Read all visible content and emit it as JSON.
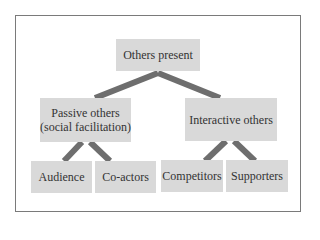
{
  "diagram": {
    "type": "tree",
    "colors": {
      "box_fill": "#d9d9d9",
      "connector": "#6e6e6e",
      "frame": "#7a7a7a",
      "text": "#333333"
    },
    "root": {
      "label": "Others present"
    },
    "level1": [
      {
        "line1": "Passive others",
        "line2": "(social facilitation)"
      },
      {
        "label": "Interactive others"
      }
    ],
    "level2": [
      {
        "label": "Audience",
        "parent": "Passive others"
      },
      {
        "label": "Co-actors",
        "parent": "Passive others"
      },
      {
        "label": "Competitors",
        "parent": "Interactive others"
      },
      {
        "label": "Supporters",
        "parent": "Interactive others"
      }
    ]
  }
}
